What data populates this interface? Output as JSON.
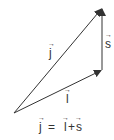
{
  "diagram": {
    "type": "vector-addition-triangle",
    "colors": {
      "line": "#333333",
      "text": "#333333",
      "background": "#ffffff"
    },
    "vectors": [
      {
        "name": "l",
        "label": "l",
        "arrow": "→",
        "from": [
          14,
          113
        ],
        "to": [
          102,
          70
        ]
      },
      {
        "name": "s",
        "label": "s",
        "arrow": "→",
        "from": [
          102,
          70
        ],
        "to": [
          102,
          8
        ]
      },
      {
        "name": "j",
        "label": "j",
        "arrow": "→",
        "from": [
          14,
          113
        ],
        "to": [
          102,
          8
        ]
      }
    ],
    "labels": {
      "j": "j",
      "l": "l",
      "s": "s",
      "arrow": "→"
    },
    "equation": {
      "lhs": "j",
      "equals": "=",
      "term1": "l",
      "plus": "+",
      "term2": "s",
      "text": "j = l + s"
    }
  }
}
